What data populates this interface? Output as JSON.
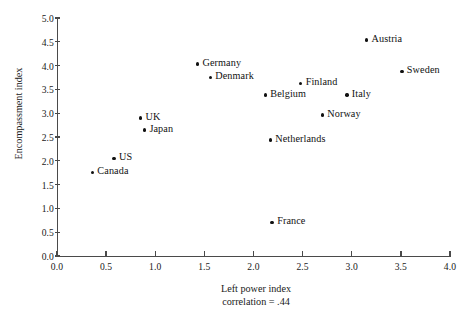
{
  "chart_data": {
    "type": "scatter",
    "title": "",
    "xlabel": "Left power index",
    "xsublabel": "correlation = .44",
    "ylabel": "Encompassment index",
    "xlim": [
      0.0,
      4.0
    ],
    "ylim": [
      0.0,
      5.0
    ],
    "grid": false,
    "legend": "none",
    "xticks": [
      "0.0",
      "0.5",
      "1.0",
      "1.5",
      "2.0",
      "2.5",
      "3.0",
      "3.5",
      "4.0"
    ],
    "xtick_values": [
      0.0,
      0.5,
      1.0,
      1.5,
      2.0,
      2.5,
      3.0,
      3.5,
      4.0
    ],
    "yticks": [
      "0.0",
      "0.5",
      "1.0",
      "1.5",
      "2.0",
      "2.5",
      "3.0",
      "3.5",
      "4.0",
      "4.5",
      "5.0"
    ],
    "ytick_values": [
      0.0,
      0.5,
      1.0,
      1.5,
      2.0,
      2.5,
      3.0,
      3.5,
      4.0,
      4.5,
      5.0
    ],
    "marker_color": "#111111",
    "axis_color": "#4a4a4a",
    "points": [
      {
        "label": "Canada",
        "x": 0.36,
        "y": 1.75,
        "label_pos": "right"
      },
      {
        "label": "US",
        "x": 0.58,
        "y": 2.05,
        "label_pos": "right"
      },
      {
        "label": "UK",
        "x": 0.85,
        "y": 2.9,
        "label_pos": "right"
      },
      {
        "label": "Japan",
        "x": 0.89,
        "y": 2.65,
        "label_pos": "right"
      },
      {
        "label": "Germany",
        "x": 1.43,
        "y": 4.03,
        "label_pos": "right"
      },
      {
        "label": "Denmark",
        "x": 1.56,
        "y": 3.75,
        "label_pos": "right"
      },
      {
        "label": "Belgium",
        "x": 2.12,
        "y": 3.38,
        "label_pos": "right"
      },
      {
        "label": "Netherlands",
        "x": 2.17,
        "y": 2.44,
        "label_pos": "right"
      },
      {
        "label": "France",
        "x": 2.19,
        "y": 0.71,
        "label_pos": "right"
      },
      {
        "label": "Finland",
        "x": 2.48,
        "y": 3.63,
        "label_pos": "right"
      },
      {
        "label": "Norway",
        "x": 2.7,
        "y": 2.96,
        "label_pos": "right"
      },
      {
        "label": "Italy",
        "x": 2.95,
        "y": 3.38,
        "label_pos": "right"
      },
      {
        "label": "Austria",
        "x": 3.15,
        "y": 4.54,
        "label_pos": "right"
      },
      {
        "label": "Sweden",
        "x": 3.51,
        "y": 3.88,
        "label_pos": "right"
      }
    ]
  }
}
